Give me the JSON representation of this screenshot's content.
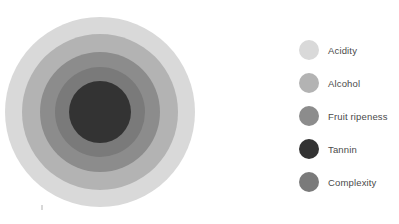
{
  "chart_data": {
    "type": "pie",
    "subtype": "nested-concentric-circles",
    "title": "",
    "xlabel": "",
    "ylabel": "",
    "grid": false,
    "legend_position": "right",
    "categories": [
      "Acidity",
      "Alcohol",
      "Fruit ripeness",
      "Tannin",
      "Complexity"
    ],
    "series": [
      {
        "name": "radius",
        "values": [
          95,
          78,
          60,
          31,
          45
        ]
      }
    ],
    "items": [
      {
        "label": "Acidity",
        "color": "#d9d9d9",
        "radius": 95,
        "order": 1
      },
      {
        "label": "Alcohol",
        "color": "#b3b3b3",
        "radius": 78,
        "order": 2
      },
      {
        "label": "Fruit ripeness",
        "color": "#8c8c8c",
        "radius": 60,
        "order": 3
      },
      {
        "label": "Tannin",
        "color": "#333333",
        "radius": 31,
        "order": 4
      },
      {
        "label": "Complexity",
        "color": "#7a7a7a",
        "radius": 45,
        "order": 5
      }
    ],
    "center": {
      "x": 100,
      "y": 112
    }
  },
  "plot": {
    "rings": [
      {
        "name": "acidity-ring",
        "color": "#d9d9d9",
        "size": 190,
        "cx": 100,
        "cy": 112
      },
      {
        "name": "alcohol-ring",
        "color": "#b3b3b3",
        "size": 156,
        "cx": 100,
        "cy": 112
      },
      {
        "name": "fruit-ripeness-ring",
        "color": "#8c8c8c",
        "size": 120,
        "cx": 100,
        "cy": 112
      },
      {
        "name": "complexity-ring",
        "color": "#7a7a7a",
        "size": 90,
        "cx": 100,
        "cy": 112
      },
      {
        "name": "tannin-ring",
        "color": "#333333",
        "size": 62,
        "cx": 100,
        "cy": 112
      }
    ]
  },
  "legend": {
    "items": [
      {
        "label": "Acidity",
        "color": "#d9d9d9",
        "top": 0
      },
      {
        "label": "Alcohol",
        "color": "#b3b3b3",
        "top": 33
      },
      {
        "label": "Fruit ripeness",
        "color": "#8c8c8c",
        "top": 66
      },
      {
        "label": "Tannin",
        "color": "#333333",
        "top": 99
      },
      {
        "label": "Complexity",
        "color": "#7a7a7a",
        "top": 132
      }
    ]
  }
}
